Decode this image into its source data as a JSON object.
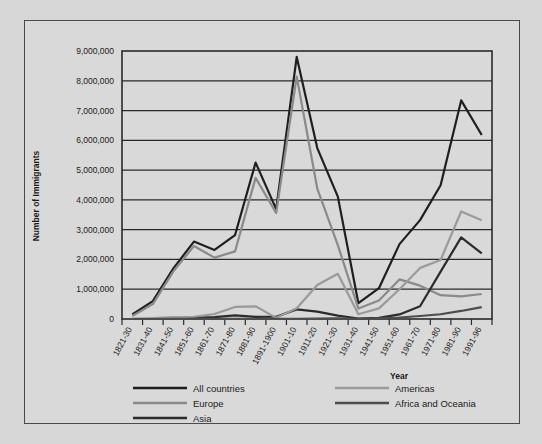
{
  "figure": {
    "background_color": "#d9d9d9",
    "border_color": "#4a4a4a"
  },
  "chart_data": {
    "type": "line",
    "title": "",
    "xlabel": "Year",
    "ylabel": "Number of Immigrants",
    "grid": true,
    "legend_position": "bottom",
    "ylim": [
      0,
      9000000
    ],
    "ytick_labels": [
      "9,000,000",
      "8,000,000",
      "7,000,000",
      "6,000,000",
      "5,000,000",
      "4,000,000",
      "3,000,000",
      "2,000,000",
      "1,000,000",
      "0"
    ],
    "ytick_values": [
      9000000,
      8000000,
      7000000,
      6000000,
      5000000,
      4000000,
      3000000,
      2000000,
      1000000,
      0
    ],
    "categories": [
      "1821-30",
      "1831-40",
      "1841-50",
      "1851-60",
      "1861-70",
      "1871-80",
      "1881-90",
      "1891-1900",
      "1901-10",
      "1911-20",
      "1921-30",
      "1931-40",
      "1941-50",
      "1951-60",
      "1961-70",
      "1971-80",
      "1981-90",
      "1991-96"
    ],
    "series": [
      {
        "name": "All countries",
        "color": "#1f1f1f",
        "width": 2.2,
        "values": [
          150000,
          600000,
          1700000,
          2600000,
          2320000,
          2820000,
          5250000,
          3690000,
          8800000,
          5740000,
          4110000,
          530000,
          1035000,
          2515000,
          3320000,
          4490000,
          7340000,
          6180000
        ]
      },
      {
        "name": "Europe",
        "color": "#8a8a8a",
        "width": 2.2,
        "values": [
          100000,
          500000,
          1600000,
          2450000,
          2060000,
          2270000,
          4740000,
          3560000,
          8140000,
          4380000,
          2480000,
          350000,
          620000,
          1330000,
          1120000,
          800000,
          760000,
          840000
        ]
      },
      {
        "name": "Asia",
        "color": "#2b2b2b",
        "width": 2.2,
        "values": [
          30,
          50,
          140,
          42000,
          65000,
          124000,
          70000,
          75000,
          324000,
          247000,
          112000,
          17000,
          37000,
          153000,
          428000,
          1590000,
          2740000,
          2200000
        ]
      },
      {
        "name": "Americas",
        "color": "#9a9a9a",
        "width": 2.2,
        "values": [
          12000,
          33000,
          62000,
          75000,
          167000,
          404000,
          427000,
          39000,
          362000,
          1144000,
          1517000,
          160000,
          355000,
          997000,
          1716000,
          1983000,
          3610000,
          3320000
        ]
      },
      {
        "name": "Africa and Oceania",
        "color": "#4d4d4d",
        "width": 2.2,
        "values": [
          20,
          60,
          1500,
          1500,
          2000,
          3000,
          2000,
          2000,
          8000,
          13000,
          20000,
          6000,
          21000,
          50000,
          100000,
          160000,
          270000,
          400000
        ]
      }
    ]
  },
  "legend": {
    "left_column": [
      {
        "label": "All countries",
        "color": "#1f1f1f",
        "width": 2.4
      },
      {
        "label": "Europe",
        "color": "#8a8a8a",
        "width": 2.4
      },
      {
        "label": "Asia",
        "color": "#2b2b2b",
        "width": 2.4
      }
    ],
    "right_column": [
      {
        "label": "Americas",
        "color": "#9a9a9a",
        "width": 2.4
      },
      {
        "label": "Africa and Oceania",
        "color": "#4d4d4d",
        "width": 2.4
      }
    ]
  }
}
